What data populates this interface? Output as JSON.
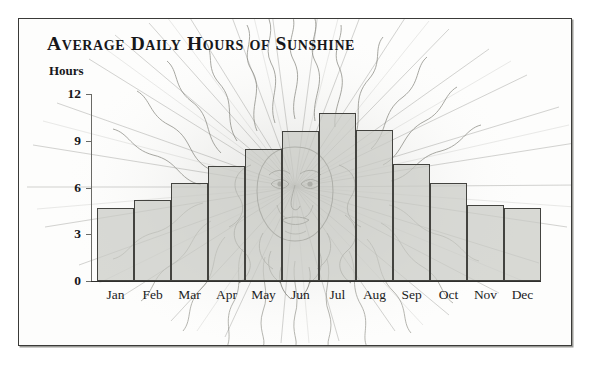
{
  "figure": {
    "title": "Average Daily Hours of Sunshine",
    "axis_label": "Hours",
    "background_color": "#fdfdfc",
    "frame_color": "#3a3a38",
    "bar_fill_color": "#c9cac5",
    "bar_edge_color": "#43433f",
    "artwork": "engraved-sun-face-with-rays"
  },
  "chart_data": {
    "type": "bar",
    "title": "Average Daily Hours of Sunshine",
    "xlabel": "",
    "ylabel": "Hours",
    "ylim": [
      0,
      12
    ],
    "yticks": [
      0,
      3,
      6,
      9,
      12
    ],
    "grid": false,
    "legend": false,
    "categories": [
      "Jan",
      "Feb",
      "Mar",
      "Apr",
      "May",
      "Jun",
      "Jul",
      "Aug",
      "Sep",
      "Oct",
      "Nov",
      "Dec"
    ],
    "values": [
      4.7,
      5.2,
      6.3,
      7.4,
      8.5,
      9.6,
      10.8,
      9.7,
      7.5,
      6.3,
      4.9,
      4.7
    ]
  }
}
